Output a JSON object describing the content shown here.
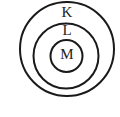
{
  "diagram": {
    "type": "concentric-shells",
    "shells": [
      {
        "label": "K",
        "cx": 67,
        "cy": 49,
        "r": 47
      },
      {
        "label": "L",
        "cx": 66,
        "cy": 56,
        "r": 33
      },
      {
        "label": "M",
        "cx": 66,
        "cy": 56,
        "r": 16
      }
    ],
    "stroke_color": "#1a1a1a",
    "background": "#ffffff"
  }
}
